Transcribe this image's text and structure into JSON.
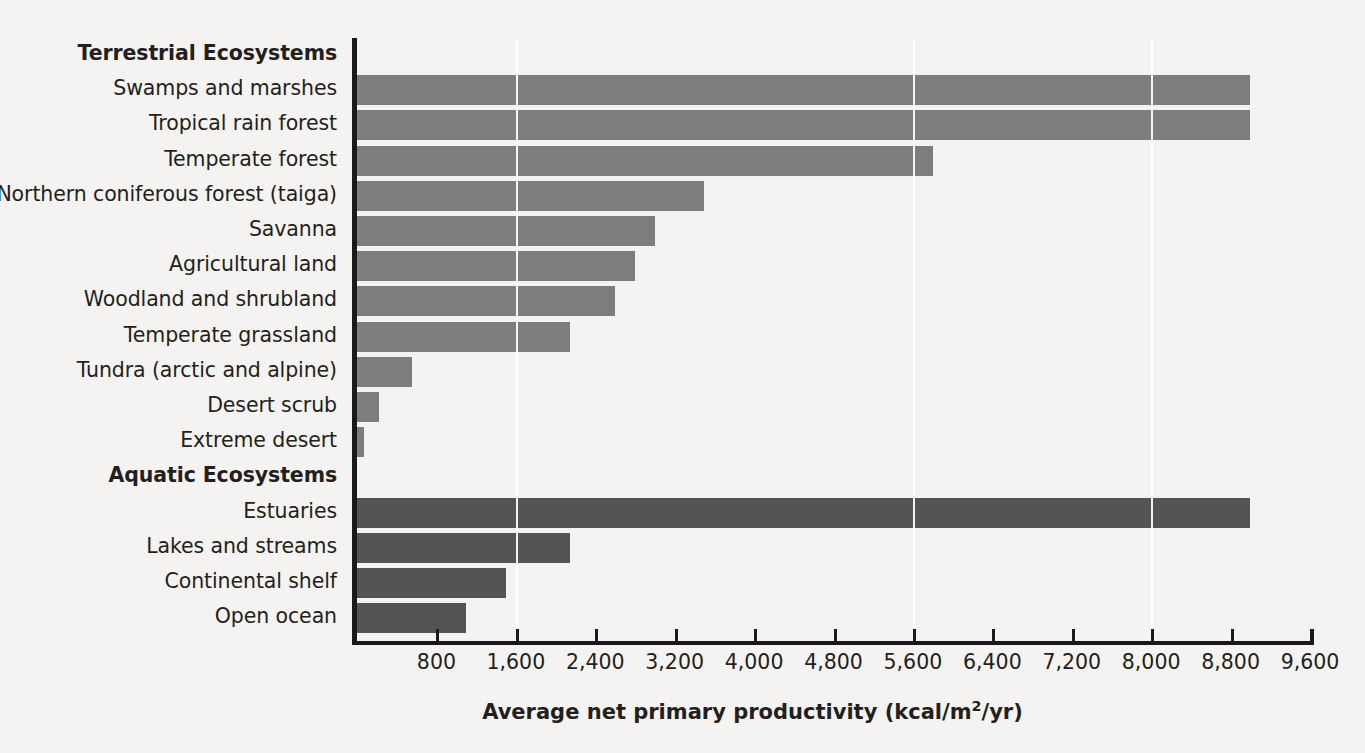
{
  "chart_data": {
    "type": "bar",
    "orientation": "horizontal",
    "title": "",
    "xlabel": "Average net primary productivity (kcal/m2/yr)",
    "xlabel_parts": {
      "before": "Average net primary productivity (kcal/m",
      "superscript": "2",
      "after": "/yr)"
    },
    "ylabel": "",
    "xlim": [
      0,
      9600
    ],
    "xticks": [
      800,
      1600,
      2400,
      3200,
      4000,
      4800,
      5600,
      6400,
      7200,
      8000,
      8800,
      9600
    ],
    "xtick_labels": [
      "800",
      "1,600",
      "2,400",
      "3,200",
      "4,000",
      "4,800",
      "5,600",
      "6,400",
      "7,200",
      "8,000",
      "8,800",
      "9,600"
    ],
    "grid": "vertical-white-at-1600-5600-and-8000",
    "gridlines": [
      1600,
      5600,
      8000
    ],
    "legend": "none",
    "group_headings": [
      "Terrestrial Ecosystems",
      "Aquatic Ecosystems"
    ],
    "series": [
      {
        "name": "Terrestrial Ecosystems",
        "color": "#7d7d7d",
        "categories": [
          "Swamps and marshes",
          "Tropical rain forest",
          "Temperate forest",
          "Northern coniferous forest (taiga)",
          "Savanna",
          "Agricultural land",
          "Woodland and shrubland",
          "Temperate grassland",
          "Tundra (arctic and alpine)",
          "Desert scrub",
          "Extreme desert"
        ],
        "values": [
          9000,
          9000,
          5800,
          3500,
          3000,
          2800,
          2600,
          2150,
          550,
          220,
          70
        ]
      },
      {
        "name": "Aquatic Ecosystems",
        "color": "#545454",
        "categories": [
          "Estuaries",
          "Lakes and streams",
          "Continental shelf",
          "Open ocean"
        ],
        "values": [
          9000,
          2150,
          1500,
          1100
        ]
      }
    ],
    "rows": [
      {
        "kind": "heading",
        "label": "Terrestrial Ecosystems"
      },
      {
        "kind": "bar",
        "label": "Swamps and marshes",
        "value": 9000,
        "group": "terrestrial"
      },
      {
        "kind": "bar",
        "label": "Tropical rain forest",
        "value": 9000,
        "group": "terrestrial"
      },
      {
        "kind": "bar",
        "label": "Temperate forest",
        "value": 5800,
        "group": "terrestrial"
      },
      {
        "kind": "bar",
        "label": "Northern coniferous forest (taiga)",
        "value": 3500,
        "group": "terrestrial"
      },
      {
        "kind": "bar",
        "label": "Savanna",
        "value": 3000,
        "group": "terrestrial"
      },
      {
        "kind": "bar",
        "label": "Agricultural land",
        "value": 2800,
        "group": "terrestrial"
      },
      {
        "kind": "bar",
        "label": "Woodland and shrubland",
        "value": 2600,
        "group": "terrestrial"
      },
      {
        "kind": "bar",
        "label": "Temperate grassland",
        "value": 2150,
        "group": "terrestrial"
      },
      {
        "kind": "bar",
        "label": "Tundra (arctic and alpine)",
        "value": 550,
        "group": "terrestrial"
      },
      {
        "kind": "bar",
        "label": "Desert scrub",
        "value": 220,
        "group": "terrestrial"
      },
      {
        "kind": "bar",
        "label": "Extreme desert",
        "value": 70,
        "group": "terrestrial"
      },
      {
        "kind": "heading",
        "label": "Aquatic Ecosystems"
      },
      {
        "kind": "bar",
        "label": "Estuaries",
        "value": 9000,
        "group": "aquatic"
      },
      {
        "kind": "bar",
        "label": "Lakes and streams",
        "value": 2150,
        "group": "aquatic"
      },
      {
        "kind": "bar",
        "label": "Continental shelf",
        "value": 1500,
        "group": "aquatic"
      },
      {
        "kind": "bar",
        "label": "Open ocean",
        "value": 1100,
        "group": "aquatic"
      }
    ]
  },
  "colors": {
    "background": "#f4f3f1",
    "terrestrial_bar": "#7d7d7d",
    "aquatic_bar": "#545454",
    "axis": "#1a1a1a",
    "text": "#231f20",
    "gridline": "#ffffff"
  }
}
